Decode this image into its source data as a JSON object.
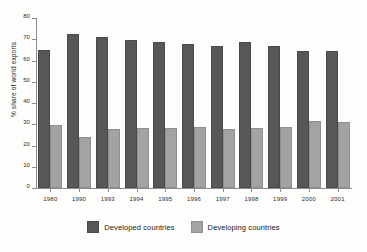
{
  "chart_data": {
    "type": "bar",
    "title": "",
    "xlabel": "",
    "ylabel": "% share of world exports",
    "ylim": [
      0,
      80
    ],
    "yticks": [
      0,
      10,
      20,
      30,
      40,
      50,
      60,
      70,
      80
    ],
    "grid": false,
    "legend_position": "bottom-center",
    "categories": [
      "1980",
      "1990",
      "1993",
      "1994",
      "1995",
      "1996",
      "1997",
      "1998",
      "1999",
      "2000",
      "2001"
    ],
    "series": [
      {
        "name": "Developed countries",
        "color": "#575757",
        "values": [
          64,
          71.5,
          70,
          68.5,
          68,
          67,
          66,
          68,
          66,
          63.5,
          63.5
        ]
      },
      {
        "name": "Developing countries",
        "color": "#a3a3a3",
        "values": [
          28.5,
          23,
          27,
          27.5,
          27.5,
          28,
          27,
          27.5,
          28,
          30.5,
          30
        ]
      }
    ]
  },
  "legend": {
    "entries": [
      {
        "label": "Developed countries",
        "swatch": "dev"
      },
      {
        "label": "Developing countries",
        "swatch": "devg"
      }
    ]
  }
}
